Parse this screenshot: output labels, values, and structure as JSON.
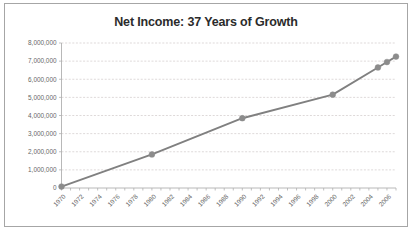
{
  "chart": {
    "title": "Net Income: 37 Years of Growth",
    "border_color": "#a6a6a6",
    "background_color": "#ffffff",
    "series_color": "#808080",
    "marker_color": "#8c8c8c",
    "grid_color": "#d0c8c8",
    "tick_text_color": "#666666"
  },
  "chart_data": {
    "type": "line",
    "title": "Net Income: 37 Years of Growth",
    "xlabel": "",
    "ylabel": "",
    "xlim": [
      1970,
      2007
    ],
    "ylim": [
      0,
      8000000
    ],
    "grid": true,
    "legend": false,
    "x_tick_labels": [
      "1970",
      "1972",
      "1974",
      "1976",
      "1978",
      "1980",
      "1982",
      "1984",
      "1986",
      "1988",
      "1990",
      "1992",
      "1994",
      "1996",
      "1998",
      "2000",
      "2002",
      "2004",
      "2006"
    ],
    "x_tick_values": [
      1970,
      1972,
      1974,
      1976,
      1978,
      1980,
      1982,
      1984,
      1986,
      1988,
      1990,
      1992,
      1994,
      1996,
      1998,
      2000,
      2002,
      2004,
      2006
    ],
    "y_tick_labels": [
      "0",
      "1,000,000",
      "2,000,000",
      "3,000,000",
      "4,000,000",
      "5,000,000",
      "6,000,000",
      "7,000,000",
      "8,000,000"
    ],
    "y_tick_values": [
      0,
      1000000,
      2000000,
      3000000,
      4000000,
      5000000,
      6000000,
      7000000,
      8000000
    ],
    "x": [
      1970,
      1980,
      1990,
      2000,
      2005,
      2006,
      2007
    ],
    "values": [
      80000,
      1850000,
      3850000,
      5150000,
      6650000,
      6950000,
      7250000
    ],
    "series": [
      {
        "name": "Net Income",
        "points": [
          {
            "x": 1970,
            "y": 80000
          },
          {
            "x": 1980,
            "y": 1850000
          },
          {
            "x": 1990,
            "y": 3850000
          },
          {
            "x": 2000,
            "y": 5150000
          },
          {
            "x": 2005,
            "y": 6650000
          },
          {
            "x": 2006,
            "y": 6950000
          },
          {
            "x": 2007,
            "y": 7250000
          }
        ]
      }
    ]
  }
}
